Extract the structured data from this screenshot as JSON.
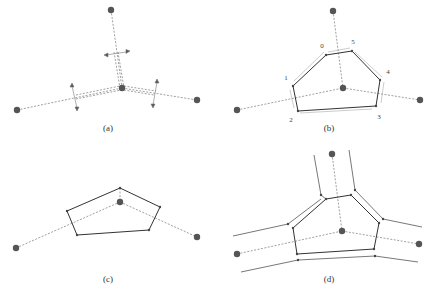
{
  "panels": [
    {
      "id": "a",
      "caption": "(a)"
    },
    {
      "id": "b",
      "caption": "(b)",
      "vertex_labels": [
        "0",
        "1",
        "2",
        "3",
        "4",
        "5"
      ]
    },
    {
      "id": "c",
      "caption": "(c)"
    },
    {
      "id": "d",
      "caption": "(d)"
    }
  ],
  "colors": {
    "site": "#555555",
    "edge": "#333333",
    "dashed": "#888888",
    "offset": "#777777"
  }
}
